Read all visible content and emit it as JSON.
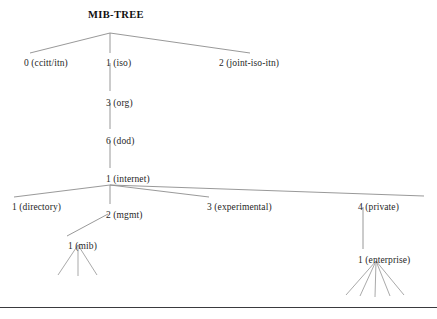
{
  "figure": {
    "title": "MIB-TREE",
    "title_x": 88,
    "title_y": 9,
    "width": 437,
    "height": 319,
    "line_color": "#8d8d8d",
    "text_color": "#1f1f1f",
    "rule_color": "#3a3a3e",
    "rule_y": 307,
    "background": "#ffffff"
  },
  "nodes": [
    {
      "id": "ccitt",
      "label": "0 (ccitt/itn)",
      "label_x": 24,
      "label_y": 58,
      "anchor_x": 55,
      "anchor_y": 56
    },
    {
      "id": "iso",
      "label": "1 (iso)",
      "label_x": 106,
      "label_y": 58,
      "anchor_x": 110,
      "anchor_y": 56
    },
    {
      "id": "joint",
      "label": "2 (joint-iso-itn)",
      "label_x": 219,
      "label_y": 58,
      "anchor_x": 246,
      "anchor_y": 56
    },
    {
      "id": "org",
      "label": "3 (org)",
      "label_x": 106,
      "label_y": 98,
      "anchor_x": 110,
      "anchor_y": 96
    },
    {
      "id": "dod",
      "label": "6 (dod)",
      "label_x": 106,
      "label_y": 136,
      "anchor_x": 110,
      "anchor_y": 134
    },
    {
      "id": "internet",
      "label": "1 (internet)",
      "label_x": 106,
      "label_y": 174,
      "anchor_x": 110,
      "anchor_y": 172
    },
    {
      "id": "directory",
      "label": "1 (directory)",
      "label_x": 12,
      "label_y": 202,
      "anchor_x": 18,
      "anchor_y": 200
    },
    {
      "id": "mgmt",
      "label": "2 (mgmt)",
      "label_x": 106,
      "label_y": 210,
      "anchor_x": 110,
      "anchor_y": 208
    },
    {
      "id": "experimental",
      "label": "3 (experimental)",
      "label_x": 207,
      "label_y": 202,
      "anchor_x": 212,
      "anchor_y": 200
    },
    {
      "id": "private",
      "label": "4 (private)",
      "label_x": 358,
      "label_y": 202,
      "anchor_x": 363,
      "anchor_y": 200
    },
    {
      "id": "mib",
      "label": "1 (mib)",
      "label_x": 68,
      "label_y": 241,
      "anchor_x": 76,
      "anchor_y": 239
    },
    {
      "id": "enterprise",
      "label": "1 (enterprise)",
      "label_x": 358,
      "label_y": 255,
      "anchor_x": 363,
      "anchor_y": 253
    }
  ],
  "edges": [
    {
      "from": "root-junction",
      "to": "ccitt",
      "x1": 110,
      "y1": 33,
      "x2": 30,
      "y2": 53
    },
    {
      "from": "root-junction",
      "to": "iso",
      "x1": 110,
      "y1": 33,
      "x2": 110,
      "y2": 53
    },
    {
      "from": "root-junction",
      "to": "joint",
      "x1": 110,
      "y1": 33,
      "x2": 250,
      "y2": 53
    },
    {
      "from": "iso",
      "to": "org",
      "x1": 110,
      "y1": 63,
      "x2": 110,
      "y2": 91
    },
    {
      "from": "org",
      "to": "dod",
      "x1": 110,
      "y1": 102,
      "x2": 110,
      "y2": 129
    },
    {
      "from": "dod",
      "to": "internet",
      "x1": 110,
      "y1": 141,
      "x2": 110,
      "y2": 168
    },
    {
      "from": "internet",
      "to": "directory",
      "x1": 110,
      "y1": 185,
      "x2": 14,
      "y2": 197
    },
    {
      "from": "internet",
      "to": "mgmt",
      "x1": 110,
      "y1": 185,
      "x2": 110,
      "y2": 204
    },
    {
      "from": "internet",
      "to": "experimental",
      "x1": 110,
      "y1": 185,
      "x2": 209,
      "y2": 197
    },
    {
      "from": "internet",
      "to": "private",
      "x1": 110,
      "y1": 185,
      "x2": 424,
      "y2": 196
    },
    {
      "from": "mgmt",
      "to": "mib",
      "x1": 108,
      "y1": 214,
      "x2": 67,
      "y2": 236
    },
    {
      "from": "private",
      "to": "enterprise",
      "x1": 363,
      "y1": 207,
      "x2": 363,
      "y2": 249
    }
  ],
  "leaf_stubs": [
    {
      "parent": "mib",
      "count": 3,
      "origin_x": 78,
      "origin_y": 245,
      "endpoints": [
        {
          "x": 58,
          "y": 275
        },
        {
          "x": 78,
          "y": 276
        },
        {
          "x": 97,
          "y": 275
        }
      ]
    },
    {
      "parent": "enterprise",
      "count": 5,
      "origin_x": 376,
      "origin_y": 261,
      "endpoints": [
        {
          "x": 346,
          "y": 295
        },
        {
          "x": 360,
          "y": 296
        },
        {
          "x": 375,
          "y": 297
        },
        {
          "x": 390,
          "y": 296
        },
        {
          "x": 404,
          "y": 295
        }
      ]
    }
  ]
}
